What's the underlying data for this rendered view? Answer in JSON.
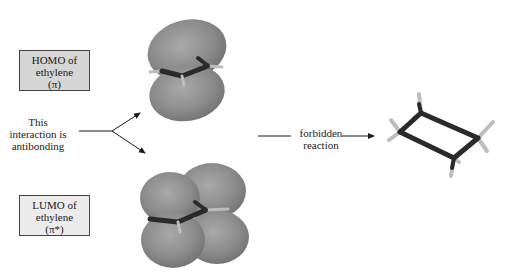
{
  "homo_box": {
    "line1": "HOMO of",
    "line2": "ethylene",
    "line3": "(π)"
  },
  "lumo_box": {
    "line1": "LUMO of",
    "line2": "ethylene",
    "line3": "(π*)"
  },
  "interaction_note": {
    "line1": "This",
    "line2": "interaction is",
    "line3": "antibonding"
  },
  "reaction_arrow": {
    "line1": "forbidden",
    "line2": "reaction"
  },
  "colors": {
    "orbital_lobe": "#8a8a8a",
    "orbital_lobe_light": "#a8a8a8",
    "bond": "#2a2a2a",
    "hydrogen": "#bdbdbd",
    "homo_box_fill": "#d6d6d6",
    "lumo_box_fill": "#ececec"
  },
  "molecules": {
    "homo": "ethylene-pi-orbital",
    "lumo": "ethylene-pi-star-orbital",
    "product": "cyclobutane"
  }
}
